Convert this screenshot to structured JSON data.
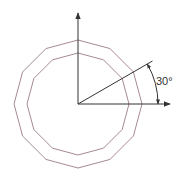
{
  "diagram": {
    "type": "geometry",
    "center": [
      78,
      104
    ],
    "outer_polygon": {
      "sides": 12,
      "radius": 64,
      "color": "#9a7d84"
    },
    "inner_polygon": {
      "sides": 12,
      "radius": 51,
      "color": "#9a7d84"
    },
    "axes": {
      "color": "#333333",
      "x_axis_end": [
        170,
        104
      ],
      "y_axis_end": [
        78,
        13
      ]
    },
    "angle_line": {
      "angle_deg": 30,
      "length": 86
    },
    "angle_arc": {
      "radius": 80,
      "from_deg": 0,
      "to_deg": 30
    },
    "angle_label": "30°"
  }
}
